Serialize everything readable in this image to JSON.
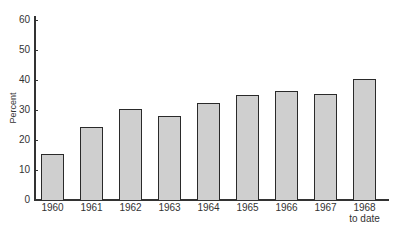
{
  "chart_data": {
    "type": "bar",
    "title": "",
    "xlabel": "",
    "ylabel": "Percent",
    "ylim": [
      0,
      60
    ],
    "yticks": [
      0,
      10,
      20,
      30,
      40,
      50,
      60
    ],
    "grid": false,
    "legend": null,
    "categories": [
      "1960",
      "1961",
      "1962",
      "1963",
      "1964",
      "1965",
      "1966",
      "1967",
      "1968 to date"
    ],
    "category_labels": [
      {
        "line1": "1960",
        "line2": ""
      },
      {
        "line1": "1961",
        "line2": ""
      },
      {
        "line1": "1962",
        "line2": ""
      },
      {
        "line1": "1963",
        "line2": ""
      },
      {
        "line1": "1964",
        "line2": ""
      },
      {
        "line1": "1965",
        "line2": ""
      },
      {
        "line1": "1966",
        "line2": ""
      },
      {
        "line1": "1967",
        "line2": ""
      },
      {
        "line1": "1968",
        "line2": "to date"
      }
    ],
    "values": [
      15.5,
      24.5,
      30.5,
      28,
      32.5,
      35,
      36.5,
      35.5,
      40.5
    ],
    "colors": {
      "bar_fill": "#cfcfcf",
      "bar_edge": "#2a2a2a",
      "axis": "#333333"
    }
  }
}
